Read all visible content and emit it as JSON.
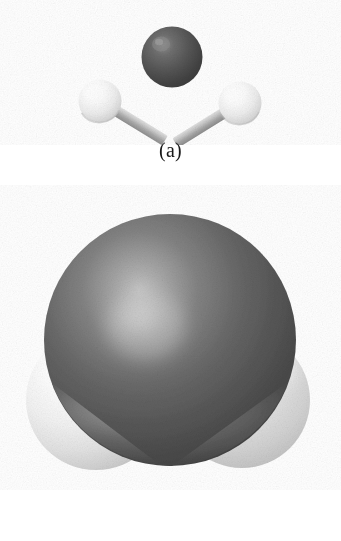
{
  "figure": {
    "background_color": "#ffffff",
    "width": 341,
    "height": 541,
    "molecule": "H2O",
    "panels": [
      {
        "id": "a",
        "caption": "(a)",
        "model_type": "ball-and-stick",
        "description": "Ball-and-stick model of a water molecule",
        "atoms": [
          {
            "element": "O",
            "role": "central-atom",
            "label": "oxygen",
            "color": "#4d4d4d",
            "highlight_color": "#8c8c8c",
            "cx": 172,
            "cy": 57,
            "r": 30
          },
          {
            "element": "H",
            "role": "terminal-atom",
            "label": "hydrogen-left",
            "color": "#f2f2f2",
            "highlight_color": "#ffffff",
            "cx": 100,
            "cy": 101,
            "r": 21
          },
          {
            "element": "H",
            "role": "terminal-atom",
            "label": "hydrogen-right",
            "color": "#f2f2f2",
            "highlight_color": "#ffffff",
            "cx": 240,
            "cy": 103,
            "r": 21
          }
        ],
        "bonds": [
          {
            "from": "O",
            "to": "hydrogen-left",
            "color": "#b3b3b3",
            "width": 11
          },
          {
            "from": "O",
            "to": "hydrogen-right",
            "color": "#b3b3b3",
            "width": 11
          }
        ]
      },
      {
        "id": "b",
        "caption": "(b)",
        "model_type": "space-filling",
        "description": "Space-filling (CPK) model of a water molecule",
        "atoms": [
          {
            "element": "O",
            "role": "central-atom",
            "label": "oxygen",
            "color": "#555555",
            "highlight_color": "#b0b0b0",
            "cx": 170,
            "cy": 340,
            "r": 126
          },
          {
            "element": "H",
            "role": "terminal-atom",
            "label": "hydrogen-left",
            "color": "#e6e6e6",
            "highlight_color": "#ffffff",
            "cx": 96,
            "cy": 400,
            "r": 70
          },
          {
            "element": "H",
            "role": "terminal-atom",
            "label": "hydrogen-right",
            "color": "#d9d9d9",
            "highlight_color": "#f7f7f7",
            "cx": 242,
            "cy": 400,
            "r": 68
          }
        ]
      }
    ],
    "colors": {
      "oxygen_dark": "#4d4d4d",
      "hydrogen_light": "#f0f0f0",
      "bond_gray": "#b3b3b3",
      "caption_text": "#1a1a1a",
      "background": "#ffffff"
    }
  }
}
